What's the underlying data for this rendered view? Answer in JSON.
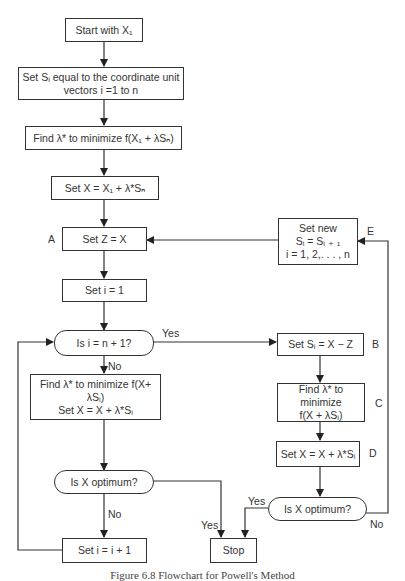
{
  "flowchart": {
    "nodes": {
      "start": {
        "line1": "Start with X₁"
      },
      "set_s": {
        "line1": "Set Sᵢ equal to the coordinate unit",
        "line2": "vectors i =1 to n"
      },
      "find_lambda_n": {
        "line1": "Find λ* to minimize f(X₁ + λSₙ)"
      },
      "set_x1": {
        "line1": "Set X = X₁ + λ*Sₙ"
      },
      "set_z": {
        "line1": "Set Z = X"
      },
      "set_i1": {
        "line1": "Set i = 1"
      },
      "is_i_n1": {
        "line1": "Is i = n + 1?"
      },
      "find_lambda_i": {
        "line1": "Find λ* to minimize f(X+ λSᵢ)",
        "line2": "Set X = X + λ*Sᵢ"
      },
      "is_x_opt_left": {
        "line1": "Is X optimum?"
      },
      "set_i_inc": {
        "line1": "Set i = i + 1"
      },
      "stop": {
        "line1": "Stop"
      },
      "set_new": {
        "line1": "Set new",
        "line2": "Sᵢ = Sᵢ ₊ ₁",
        "line3": "i = 1, 2,. . . , n"
      },
      "set_si_xz": {
        "line1": "Set Sᵢ = X − Z"
      },
      "find_lambda_c": {
        "line1": "Find λ* to minimize",
        "line2": "f(X + λSᵢ)"
      },
      "set_x_d": {
        "line1": "Set X = X + λ*Sᵢ"
      },
      "is_x_opt_right": {
        "line1": "Is X optimum?"
      }
    },
    "point_labels": {
      "a": "A",
      "b": "B",
      "c": "C",
      "d": "D",
      "e": "E"
    },
    "edge_labels": {
      "yes_top": "Yes",
      "no_mid": "No",
      "no_left": "No",
      "yes_left_opt": "Yes",
      "yes_right_opt": "Yes",
      "no_right_opt": "No"
    }
  },
  "caption": "Figure 6.8  Flowchart for Powell's Method"
}
